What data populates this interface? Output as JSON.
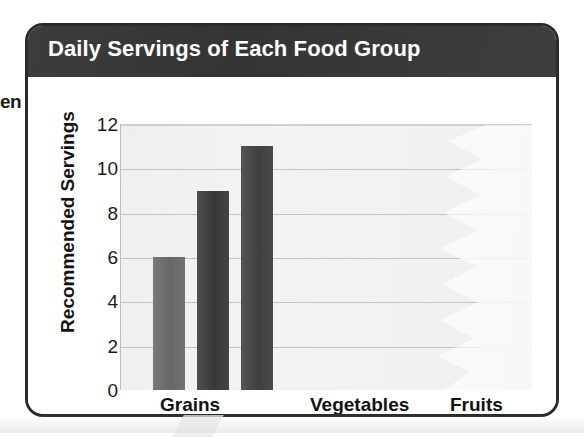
{
  "page": {
    "edge_text_fragment": "en"
  },
  "figure": {
    "title": "Daily Servings of Each Food Group"
  },
  "chart_data": {
    "type": "bar",
    "title": "Daily Servings of Each Food Group",
    "xlabel": "",
    "ylabel": "Recommended Servings",
    "categories": [
      "Grains",
      "Vegetables",
      "Fruits"
    ],
    "values": [
      6,
      9,
      11
    ],
    "bar_colors": [
      "#6b6b6b",
      "#3a3a3a",
      "#414141"
    ],
    "ylim": [
      0,
      12
    ],
    "ytick_labels": [
      "12",
      "10",
      "8",
      "6",
      "4",
      "2",
      "0"
    ],
    "ytick_values": [
      12,
      10,
      8,
      6,
      4,
      2,
      0
    ],
    "grid": true,
    "grid_axis": "y",
    "legend": false,
    "note": "Only the three bars for the Grains group are drawn; the Vegetables and Fruits regions of the plot are blank in this scan.",
    "plot_background": "#f1f1f1",
    "gridline_color": "#c2c2c2",
    "title_bar_color": "#3a3a3a",
    "title_text_color": "#ffffff",
    "frame_color": "#2b2b2b"
  }
}
